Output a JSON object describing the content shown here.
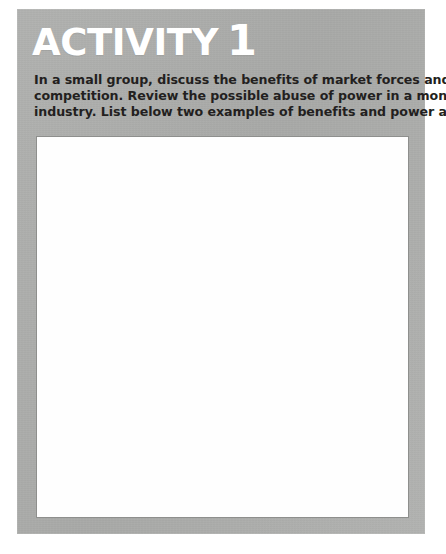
{
  "page": {
    "background_color": "#ffffff",
    "width": 446,
    "height": 554
  },
  "activity": {
    "panel_color": "#b1b2b0",
    "title": {
      "word": "ACTIVITY",
      "number": "1",
      "color": "#ffffff",
      "full_text": "ACTIVITY 1"
    },
    "instructions": {
      "full_text": "In a small group, discuss the benefits of market forces and competition. Review the possible abuse of power in a monopoly industry. List below two examples of benefits and power abuses.",
      "color": "#231f20",
      "lines": [
        "In a small group, discuss the benefits of market forces and",
        "competition. Review the possible abuse of power in a monopoly",
        "industry. List below two examples of benefits and power abuses."
      ]
    },
    "answer_box": {
      "value": "",
      "placeholder": "",
      "background_color": "#ffffff",
      "border_color": "#8e8f8d"
    }
  }
}
